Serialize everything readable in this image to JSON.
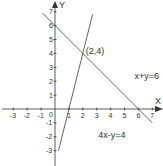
{
  "chart_data": {
    "type": "line",
    "title": "",
    "xlabel": "X",
    "ylabel": "Y",
    "xlim": [
      -3.8,
      7.5
    ],
    "ylim": [
      -3.4,
      7.5
    ],
    "grid": false,
    "x_ticks": [
      -3,
      -2,
      -1,
      0,
      1,
      2,
      3,
      4,
      5,
      6,
      7
    ],
    "y_ticks": [
      -3,
      -2,
      -1,
      1,
      2,
      3,
      4,
      5,
      6,
      7
    ],
    "origin_label": "0",
    "series": [
      {
        "name": "x+y=6",
        "equation": "x+y=6",
        "x": [
          -0.9,
          7.0
        ],
        "y": [
          6.9,
          -1.0
        ]
      },
      {
        "name": "4x-y=4",
        "equation": "4x-y=4",
        "x": [
          0.25,
          2.7
        ],
        "y": [
          -3.0,
          6.8
        ]
      }
    ],
    "annotations": [
      {
        "text": "(2,4)",
        "x": 2,
        "y": 4
      },
      {
        "text": "x+y=6",
        "x": 5.5,
        "y": 2.2
      },
      {
        "text": "4x-y=4",
        "x": 2.9,
        "y": -2.0
      }
    ],
    "colors": {
      "axis": "#333333",
      "line": "#555555",
      "text": "#333333"
    }
  }
}
